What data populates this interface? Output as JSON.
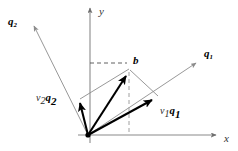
{
  "figure": {
    "background_color": "#ffffff",
    "width": 238,
    "height": 151
  },
  "axes": {
    "x_label": "x",
    "y_label": "y",
    "origin": {
      "x": 88,
      "y": 135,
      "label": ""
    },
    "x_axis": {
      "from_x": 78,
      "to_x": 218,
      "y": 135,
      "arrow": true
    },
    "y_axis": {
      "x": 90,
      "from_y": 143,
      "to_y": 5,
      "arrow": true
    },
    "color": "#7a7a7a"
  },
  "labels": {
    "q1": "q",
    "q1_sub": "1",
    "q2": "q",
    "q2_sub": "2",
    "b": "b",
    "v1q1_scalar": "v",
    "v1q1_scalar_sub": "1",
    "v1q1_vector": "q",
    "v1q1_vector_sub": "1",
    "v2q2_scalar": "v",
    "v2q2_scalar_sub": "2",
    "v2q2_vector": "q",
    "v2q2_vector_sub": "2"
  },
  "vectors": [
    {
      "name": "q1-ray",
      "style": "thin",
      "color": "#8c8c8c",
      "from": {
        "x": 88,
        "y": 135
      },
      "to": {
        "x": 198,
        "y": 62
      },
      "label": "q1"
    },
    {
      "name": "q2-ray",
      "style": "thin",
      "color": "#8c8c8c",
      "from": {
        "x": 88,
        "y": 135
      },
      "to": {
        "x": 33,
        "y": 24
      },
      "label": "q2"
    },
    {
      "name": "v1q1-component",
      "style": "bold",
      "color": "#000000",
      "from": {
        "x": 88,
        "y": 135
      },
      "to": {
        "x": 157,
        "y": 97
      },
      "label": "v1 q1"
    },
    {
      "name": "v2q2-component",
      "style": "bold",
      "color": "#000000",
      "from": {
        "x": 88,
        "y": 135
      },
      "to": {
        "x": 78,
        "y": 99
      },
      "label": "v2 q2"
    },
    {
      "name": "b-resultant",
      "style": "bold",
      "color": "#000000",
      "from": {
        "x": 88,
        "y": 135
      },
      "to": {
        "x": 129,
        "y": 70
      },
      "label": "b"
    }
  ],
  "parallelogram_edges": [
    {
      "name": "edge-v2q2-to-b",
      "from": {
        "x": 80,
        "y": 99
      },
      "to": {
        "x": 129,
        "y": 69
      },
      "color": "#8c8c8c"
    },
    {
      "name": "edge-v1q1-to-b",
      "from": {
        "x": 158,
        "y": 96
      },
      "to": {
        "x": 129,
        "y": 69
      },
      "color": "#8c8c8c"
    }
  ],
  "guide_lines": [
    {
      "name": "horizontal-projection-dash",
      "from": {
        "x": 90,
        "y": 63
      },
      "to": {
        "x": 128,
        "y": 63
      },
      "dash": "4,3",
      "color": "#555555"
    },
    {
      "name": "vertical-projection-dash",
      "from": {
        "x": 129,
        "y": 70
      },
      "to": {
        "x": 129,
        "y": 135
      },
      "dash": "4,3",
      "color": "#9a9a9a"
    }
  ],
  "points": [
    {
      "name": "origin-dot",
      "x": 88,
      "y": 135,
      "r": 2.6,
      "color": "#000000"
    }
  ]
}
